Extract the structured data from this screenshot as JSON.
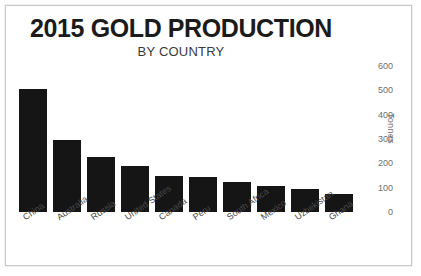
{
  "chart_data": {
    "type": "bar",
    "title": "2015 GOLD PRODUCTION",
    "subtitle": "BY COUNTRY",
    "xlabel": "",
    "ylabel": "Tonnes",
    "ylim": [
      0,
      600
    ],
    "yticks": [
      600,
      500,
      400,
      300,
      200,
      100,
      0
    ],
    "grid": false,
    "legend": false,
    "bar_color": "#151515",
    "categories": [
      "China",
      "Australia",
      "Russia",
      "United States",
      "Canada",
      "Peru",
      "South Africa",
      "Mexico",
      "Uzbekistan",
      "Ghana"
    ],
    "values": [
      505,
      295,
      225,
      190,
      150,
      145,
      125,
      105,
      95,
      75
    ]
  },
  "frame": {
    "border_color": "#c9c9c9",
    "background": "#ffffff"
  }
}
